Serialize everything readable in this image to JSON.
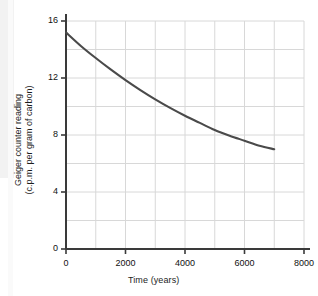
{
  "chart_data": {
    "type": "line",
    "title": "",
    "subtitle": "",
    "xlabel": "Time (years)",
    "ylabel": "Geiger counter  reading (c.p.m. per gram of carbon)",
    "ylabel_lines": [
      "Geiger counter  reading",
      "(c.p.m. per gram of carbon)"
    ],
    "xlim": [
      0,
      8000
    ],
    "ylim": [
      0,
      16
    ],
    "xticks": [
      0,
      2000,
      4000,
      6000,
      8000
    ],
    "xtick_labels": [
      "0",
      "2000",
      "4000",
      "6000",
      "8000"
    ],
    "yticks": [
      0,
      4,
      8,
      12,
      16
    ],
    "ytick_labels": [
      "0",
      "4",
      "8",
      "12",
      "16"
    ],
    "grid": true,
    "grid_x_step": 1000,
    "grid_y_step": 2,
    "grid_color": "#d8d8d8",
    "axis_color": "#3a3a3a",
    "legend": null,
    "legend_position": "none",
    "series": [
      {
        "name": "Geiger counter reading",
        "color": "#4a4a4a",
        "line_width": 2.1,
        "x": [
          0,
          500,
          1000,
          1500,
          2000,
          2500,
          3000,
          3500,
          4000,
          4500,
          5000,
          5500,
          6000,
          6500,
          7000
        ],
        "y": [
          15.2,
          14.25,
          13.4,
          12.6,
          11.85,
          11.15,
          10.5,
          9.9,
          9.35,
          8.85,
          8.35,
          7.95,
          7.6,
          7.25,
          7.0
        ]
      }
    ]
  },
  "axes": {
    "x_title": "Time (years)",
    "y_title_line1": "Geiger counter  reading",
    "y_title_line2": "(c.p.m. per gram of carbon)"
  }
}
